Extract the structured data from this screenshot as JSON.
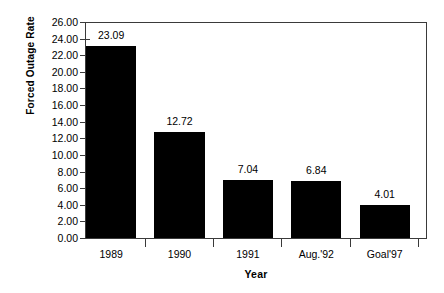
{
  "chart_data": {
    "type": "bar",
    "title": "",
    "xlabel": "Year",
    "ylabel": "Forced Outage Rate",
    "categories": [
      "1989",
      "1990",
      "1991",
      "Aug.'92",
      "Goal'97"
    ],
    "values": [
      23.09,
      12.72,
      7.04,
      6.84,
      4.01
    ],
    "value_labels": [
      "23.09",
      "12.72",
      "7.04",
      "6.84",
      "4.01"
    ],
    "ylim": [
      0,
      26
    ],
    "ytick_step": 2,
    "ytick_labels": [
      "26.00",
      "24.00",
      "22.00",
      "20.00",
      "18.00",
      "16.00",
      "14.00",
      "12.00",
      "10.00",
      "8.00",
      "6.00",
      "4.00",
      "2.00",
      "0.00"
    ],
    "ytick_values": [
      26,
      24,
      22,
      20,
      18,
      16,
      14,
      12,
      10,
      8,
      6,
      4,
      2,
      0
    ],
    "grid": false,
    "legend": false,
    "legend_position": "none",
    "bar_color": "#000000",
    "axis_color": "#3a3a3a",
    "background_color": "#ffffff"
  }
}
